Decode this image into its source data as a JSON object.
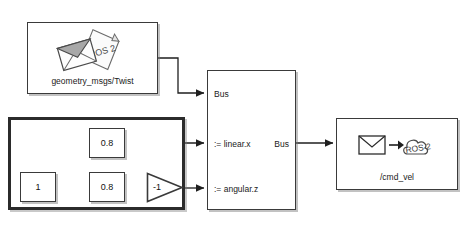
{
  "diagram": {
    "type": "simulink-block-diagram",
    "background": "#ffffff",
    "line_color": "#1f1f1f"
  },
  "blocks": {
    "message_block": {
      "label": "geometry_msgs/Twist",
      "icon": "ros2-message-envelope-icon",
      "icon_text": "ROS 2",
      "x": 27,
      "y": 22,
      "w": 131,
      "h": 72
    },
    "subsystem": {
      "name": "gain-subsystem",
      "x": 8,
      "y": 117,
      "w": 177,
      "h": 93
    },
    "constant": {
      "value": "1",
      "x": 20,
      "y": 172,
      "w": 36,
      "h": 30
    },
    "gain_linear": {
      "value": "0.8",
      "x": 89,
      "y": 128,
      "w": 36,
      "h": 30
    },
    "gain_angular": {
      "value": "0.8",
      "x": 89,
      "y": 172,
      "w": 36,
      "h": 30
    },
    "gain_negate": {
      "value": "-1",
      "x": 146,
      "y": 172,
      "w": 38,
      "h": 31
    },
    "bus_assignment": {
      "input_ports": [
        "Bus",
        ":= linear.x",
        ":= angular.z"
      ],
      "output_port": "Bus",
      "x": 207,
      "y": 70,
      "w": 89,
      "h": 140
    },
    "publisher": {
      "label": "/cmd_vel",
      "icon": "ros2-publish-cloud-icon",
      "icon_text": "ROS 2",
      "x": 336,
      "y": 118,
      "w": 122,
      "h": 72
    }
  }
}
